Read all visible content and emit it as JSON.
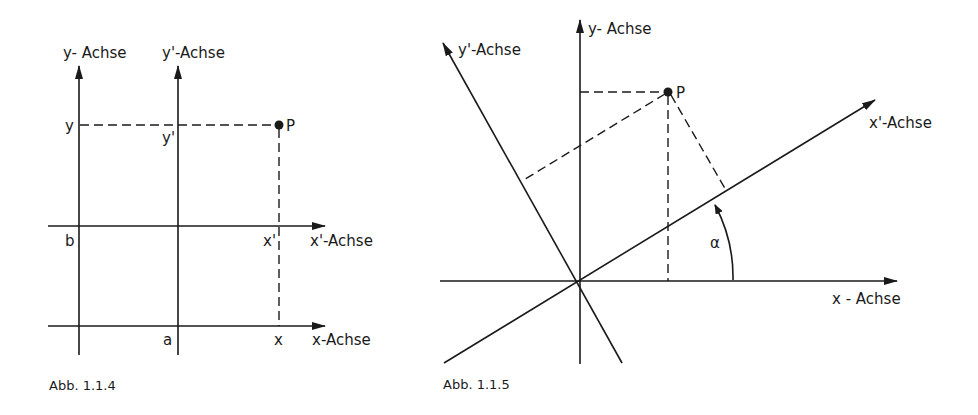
{
  "figures": [
    {
      "caption": "Abb. 1.1.4",
      "labels": {
        "y_axis": "y- Achse",
        "y_prime_axis": "y'-Achse",
        "x_axis": "x-Achse",
        "x_prime_axis": "x'-Achse",
        "y": "y",
        "y_prime": "y'",
        "x": "x",
        "x_prime": "x'",
        "a": "a",
        "b": "b",
        "point": "P"
      }
    },
    {
      "caption": "Abb. 1.1.5",
      "labels": {
        "y_axis": "y- Achse",
        "y_prime_axis": "y'-Achse",
        "x_axis": "x - Achse",
        "x_prime_axis": "x'-Achse",
        "angle": "α",
        "point": "P"
      }
    }
  ]
}
